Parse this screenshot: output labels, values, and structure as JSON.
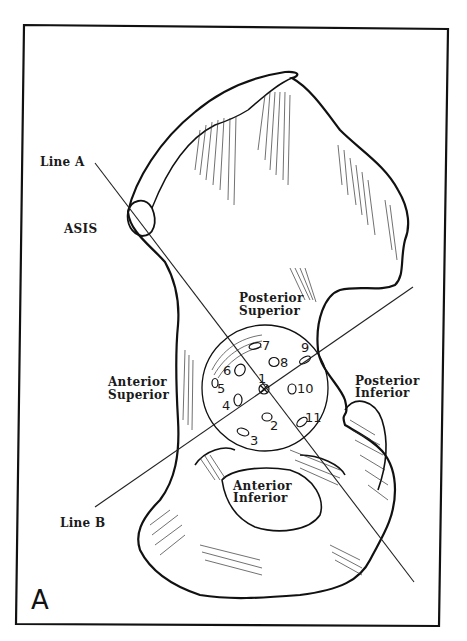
{
  "figure": {
    "panel_label": "A",
    "labels": {
      "line_a": "Line A",
      "line_b": "Line B",
      "asis": "ASIS",
      "posterior_superior": [
        "Posterior",
        "Superior"
      ],
      "anterior_superior": [
        "Anterior",
        "Superior"
      ],
      "posterior_inferior": [
        "Posterior",
        "Inferior"
      ],
      "anterior_inferior": [
        "Anterior",
        "Inferior"
      ]
    },
    "portal_numbers": [
      "1",
      "2",
      "3",
      "4",
      "5",
      "6",
      "7",
      "8",
      "9",
      "10",
      "11"
    ],
    "colors": {
      "ink": "#111111",
      "background": "#ffffff"
    }
  }
}
